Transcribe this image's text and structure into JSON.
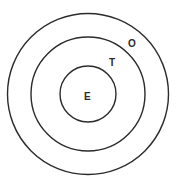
{
  "diagram": {
    "type": "concentric-circles",
    "stroke_color": "#2b2b2b",
    "background": "#ffffff",
    "center": {
      "x": 88,
      "y": 94
    },
    "rings": [
      {
        "name": "outer",
        "label": "O",
        "radius": 81
      },
      {
        "name": "middle",
        "label": "T",
        "radius": 57
      },
      {
        "name": "inner",
        "label": "E",
        "radius": 28
      }
    ],
    "labels": {
      "outer": "O",
      "middle": "T",
      "inner": "E"
    }
  }
}
